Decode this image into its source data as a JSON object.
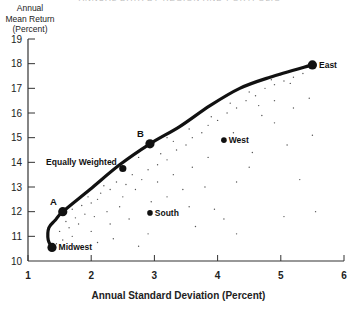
{
  "chart_data": {
    "type": "scatter",
    "title": "",
    "xlabel": "Annual Standard Deviation (Percent)",
    "ylabel": [
      "Annual",
      "Mean Return",
      "(Percent)"
    ],
    "xlim": [
      1,
      6
    ],
    "ylim": [
      10,
      19
    ],
    "x_ticks": [
      1,
      2,
      3,
      4,
      5,
      6
    ],
    "y_ticks": [
      10,
      11,
      12,
      13,
      14,
      15,
      16,
      17,
      18,
      19
    ],
    "grid": false,
    "legend": null,
    "labeled_points": [
      {
        "label": "Midwest",
        "x": 1.38,
        "y": 10.55,
        "label_side": "right"
      },
      {
        "label": "A",
        "x": 1.55,
        "y": 12.0,
        "label_side": "above-left"
      },
      {
        "label": "Equally Weighted",
        "x": 2.5,
        "y": 13.75,
        "label_side": "left-above"
      },
      {
        "label": "B",
        "x": 2.93,
        "y": 14.75,
        "label_side": "above-left"
      },
      {
        "label": "South",
        "x": 2.93,
        "y": 11.95,
        "label_side": "right"
      },
      {
        "label": "West",
        "x": 4.1,
        "y": 14.9,
        "label_side": "right"
      },
      {
        "label": "East",
        "x": 5.5,
        "y": 17.95,
        "label_side": "right"
      }
    ],
    "efficient_frontier": [
      [
        1.38,
        10.55
      ],
      [
        1.32,
        10.85
      ],
      [
        1.33,
        11.35
      ],
      [
        1.43,
        11.65
      ],
      [
        1.55,
        12.0
      ],
      [
        1.98,
        12.9
      ],
      [
        2.45,
        13.9
      ],
      [
        2.93,
        14.75
      ],
      [
        3.4,
        15.45
      ],
      [
        3.88,
        16.3
      ],
      [
        4.35,
        17.0
      ],
      [
        4.83,
        17.45
      ],
      [
        5.5,
        17.95
      ]
    ],
    "portfolio_cloud": [
      [
        1.45,
        10.7
      ],
      [
        1.55,
        10.85
      ],
      [
        1.7,
        11.0
      ],
      [
        1.5,
        11.2
      ],
      [
        1.65,
        11.35
      ],
      [
        1.8,
        11.5
      ],
      [
        1.6,
        11.6
      ],
      [
        1.75,
        11.75
      ],
      [
        1.9,
        11.9
      ],
      [
        1.7,
        12.1
      ],
      [
        1.85,
        12.25
      ],
      [
        2.0,
        12.35
      ],
      [
        2.1,
        12.5
      ],
      [
        1.95,
        12.6
      ],
      [
        2.15,
        12.75
      ],
      [
        2.3,
        12.9
      ],
      [
        2.2,
        13.05
      ],
      [
        2.4,
        13.2
      ],
      [
        2.05,
        11.8
      ],
      [
        2.25,
        12.0
      ],
      [
        2.45,
        12.2
      ],
      [
        2.3,
        11.5
      ],
      [
        2.6,
        11.7
      ],
      [
        2.0,
        11.2
      ],
      [
        2.35,
        10.9
      ],
      [
        2.75,
        10.6
      ],
      [
        2.1,
        10.75
      ],
      [
        2.5,
        12.6
      ],
      [
        2.7,
        12.9
      ],
      [
        2.55,
        13.1
      ],
      [
        2.8,
        13.3
      ],
      [
        2.65,
        13.5
      ],
      [
        2.9,
        13.7
      ],
      [
        3.05,
        13.9
      ],
      [
        3.2,
        14.1
      ],
      [
        3.1,
        14.35
      ],
      [
        3.35,
        14.5
      ],
      [
        3.5,
        14.7
      ],
      [
        3.3,
        14.85
      ],
      [
        3.6,
        15.0
      ],
      [
        3.75,
        15.2
      ],
      [
        3.55,
        15.35
      ],
      [
        3.85,
        15.5
      ],
      [
        4.0,
        15.7
      ],
      [
        3.9,
        15.85
      ],
      [
        4.15,
        16.0
      ],
      [
        4.3,
        16.2
      ],
      [
        4.2,
        16.4
      ],
      [
        4.45,
        16.5
      ],
      [
        4.6,
        16.7
      ],
      [
        4.5,
        16.85
      ],
      [
        4.75,
        17.0
      ],
      [
        4.9,
        17.15
      ],
      [
        5.05,
        17.3
      ],
      [
        5.2,
        17.45
      ],
      [
        5.35,
        17.6
      ],
      [
        5.0,
        17.55
      ],
      [
        4.85,
        17.35
      ],
      [
        5.15,
        17.2
      ],
      [
        4.65,
        16.3
      ],
      [
        4.9,
        16.5
      ],
      [
        5.2,
        16.2
      ],
      [
        3.05,
        13.2
      ],
      [
        3.3,
        13.5
      ],
      [
        3.6,
        13.8
      ],
      [
        3.85,
        14.2
      ],
      [
        3.45,
        12.9
      ],
      [
        3.8,
        13.0
      ],
      [
        3.2,
        12.6
      ],
      [
        3.55,
        12.2
      ],
      [
        2.95,
        12.4
      ],
      [
        3.95,
        12.1
      ],
      [
        4.3,
        13.2
      ],
      [
        4.1,
        11.7
      ],
      [
        4.5,
        13.8
      ],
      [
        4.9,
        15.6
      ],
      [
        5.1,
        14.7
      ],
      [
        5.45,
        16.6
      ],
      [
        5.5,
        15.1
      ],
      [
        5.3,
        13.3
      ],
      [
        5.55,
        12.0
      ],
      [
        4.3,
        11.1
      ],
      [
        5.05,
        11.8
      ],
      [
        3.65,
        11.4
      ],
      [
        2.9,
        11.1
      ],
      [
        4.55,
        14.4
      ],
      [
        4.25,
        15.2
      ],
      [
        4.7,
        15.9
      ],
      [
        3.2,
        15.0
      ],
      [
        2.75,
        14.2
      ]
    ]
  },
  "page": {
    "title_cut": "ANNUAL DATA BY REGION AND PORTFOLIO RANKS",
    "ylabel_lines": [
      "Annual",
      "Mean Return",
      "(Percent)"
    ],
    "xlabel": "Annual Standard Deviation (Percent)"
  }
}
